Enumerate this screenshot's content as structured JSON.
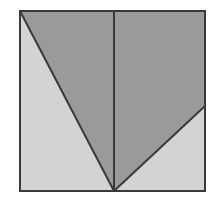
{
  "figure": {
    "canvas": {
      "width": 219,
      "height": 201,
      "background": "#ffffff"
    },
    "colors": {
      "background": "#ffffff",
      "square_fill_light": "#d3d3d3",
      "shaded_region_dark": "#9a9a9a",
      "outline_stroke": "#3a3a3a",
      "inner_line_stroke": "#3a3a3a"
    },
    "strokes": {
      "square_border_width": 2,
      "diagonal_width": 2,
      "median_width": 2
    },
    "square": {
      "name": "outer-square",
      "left": 20,
      "top": 11,
      "right": 205,
      "bottom": 191,
      "width": 185,
      "height": 180,
      "fill": "#d3d3d3",
      "stroke": "#3a3a3a"
    },
    "points": {
      "top_left": {
        "label": "A",
        "x": 20,
        "y": 11
      },
      "top_right": {
        "label": "B",
        "x": 205,
        "y": 11
      },
      "bottom_right": {
        "label": "C",
        "x": 205,
        "y": 191
      },
      "bottom_left": {
        "label": "D",
        "x": 20,
        "y": 191
      },
      "apex_bottom": {
        "label": "E",
        "x": 114,
        "y": 191
      },
      "top_mid": {
        "label": "F",
        "x": 114,
        "y": 11
      },
      "right_edge_point": {
        "label": "G",
        "x": 205,
        "y": 106
      }
    },
    "shaded_polygon": {
      "name": "shaded-v-region",
      "description": "Dark shaded region bounded by top edge, left diagonal to apex, and diagonal from apex up to right edge",
      "vertices": "20,11 205,11 205,106 114,191",
      "fill": "#9a9a9a"
    },
    "lines": [
      {
        "name": "left-diagonal",
        "from": "top_left",
        "to": "apex_bottom",
        "x1": 20,
        "y1": 11,
        "x2": 114,
        "y2": 191,
        "stroke": "#3a3a3a",
        "width": 2
      },
      {
        "name": "right-diagonal",
        "from": "apex_bottom",
        "to": "right_edge_point",
        "x1": 114,
        "y1": 191,
        "x2": 205,
        "y2": 106,
        "stroke": "#3a3a3a",
        "width": 2
      },
      {
        "name": "vertical-median",
        "from": "top_mid",
        "to": "apex_bottom",
        "x1": 114,
        "y1": 11,
        "x2": 114,
        "y2": 191,
        "stroke": "#3a3a3a",
        "width": 2
      }
    ],
    "labels": []
  }
}
